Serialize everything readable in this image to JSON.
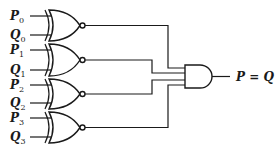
{
  "diagram": {
    "gates": [
      {
        "type": "XNOR",
        "inputs": [
          {
            "name": "P",
            "sub": "0"
          },
          {
            "name": "Q",
            "sub": "0"
          }
        ]
      },
      {
        "type": "XNOR",
        "inputs": [
          {
            "name": "P",
            "sub": "1"
          },
          {
            "name": "Q",
            "sub": "1"
          }
        ]
      },
      {
        "type": "XNOR",
        "inputs": [
          {
            "name": "P",
            "sub": "2"
          },
          {
            "name": "Q",
            "sub": "2"
          }
        ]
      },
      {
        "type": "XNOR",
        "inputs": [
          {
            "name": "P",
            "sub": "3"
          },
          {
            "name": "Q",
            "sub": "3"
          }
        ]
      }
    ],
    "and_gate": {
      "type": "AND",
      "inputs": 4
    },
    "output_label": "P = Q",
    "colors": {
      "line": "#1a1a1a",
      "background": "#ffffff"
    }
  }
}
